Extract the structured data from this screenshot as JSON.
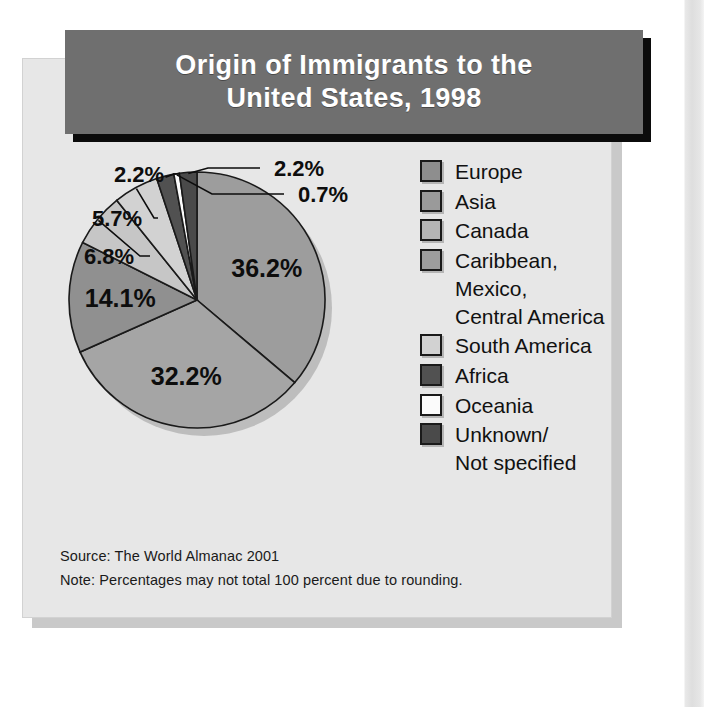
{
  "figure": {
    "title": "Origin of Immigrants to the\nUnited States, 1998",
    "source": "Source: The World Almanac 2001",
    "note": "Note: Percentages may not total 100 percent due to rounding."
  },
  "colors": {
    "panel_background": "#e7e7e7",
    "title_background": "#6f6f6f",
    "title_text": "#ffffff",
    "title_shadow": "#0b0b0b",
    "outline": "#1a1a1a",
    "page_background": "#ffffff"
  },
  "legend": {
    "items": [
      {
        "label": "Europe",
        "color": "#8e8e8e",
        "has_swatch": true
      },
      {
        "label": "Asia",
        "color": "#9a9a9a",
        "has_swatch": true
      },
      {
        "label": "Canada",
        "color": "#b4b4b4",
        "has_swatch": true
      },
      {
        "label": "Caribbean,\nMexico,\nCentral America",
        "color": "#9d9d9d",
        "has_swatch": true
      },
      {
        "label": "South America",
        "color": "#d2d2d2",
        "has_swatch": true
      },
      {
        "label": "Africa",
        "color": "#515151",
        "has_swatch": true
      },
      {
        "label": "Oceania",
        "color": "#fbfbfb",
        "has_swatch": true
      },
      {
        "label": "Unknown/\nNot specified",
        "color": "#4a4a4a",
        "has_swatch": true
      }
    ]
  },
  "chart_data": {
    "type": "pie",
    "title": "Origin of Immigrants to the United States, 1998",
    "unit": "percent",
    "legend_position": "right",
    "start_angle_deg": -90,
    "direction": "clockwise",
    "categories": [
      "Europe",
      "Asia",
      "Canada",
      "Caribbean, Mexico, Central America",
      "South America",
      "Africa",
      "Oceania",
      "Unknown/Not specified"
    ],
    "values": [
      36.2,
      32.2,
      14.1,
      6.8,
      5.7,
      2.2,
      0.7,
      2.2
    ],
    "labels": [
      "36.2%",
      "32.2%",
      "14.1%",
      "6.8%",
      "5.7%",
      "2.2%",
      "0.7%",
      "2.2%"
    ],
    "slice_colors": [
      "#9d9d9d",
      "#a5a5a5",
      "#909090",
      "#c6c6c6",
      "#d2d2d2",
      "#515151",
      "#fbfbfb",
      "#4a4a4a"
    ],
    "label_placement": [
      "inside",
      "inside",
      "inside",
      "callout",
      "callout",
      "callout",
      "callout",
      "callout"
    ],
    "total": 100.1,
    "source": "The World Almanac 2001",
    "note": "Percentages may not total 100 percent due to rounding."
  }
}
